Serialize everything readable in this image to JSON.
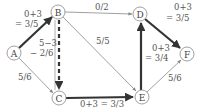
{
  "diagram": {
    "type": "flow-network",
    "nodes": [
      {
        "id": "A",
        "label": "A",
        "x": 14,
        "y": 53
      },
      {
        "id": "B",
        "label": "B",
        "x": 58,
        "y": 12
      },
      {
        "id": "C",
        "label": "C",
        "x": 59,
        "y": 98
      },
      {
        "id": "D",
        "label": "D",
        "x": 140,
        "y": 14
      },
      {
        "id": "E",
        "label": "E",
        "x": 142,
        "y": 97
      },
      {
        "id": "F",
        "label": "F",
        "x": 187,
        "y": 54
      }
    ],
    "edges": [
      {
        "from": "A",
        "to": "B",
        "style": "thick",
        "label_line1": "0+3",
        "label_line2": "= 3/5"
      },
      {
        "from": "A",
        "to": "C",
        "style": "thin",
        "label_line1": "5/6"
      },
      {
        "from": "B",
        "to": "C",
        "style": "dashed-thick",
        "label_line1": "5−3",
        "label_line2": "− 2/6"
      },
      {
        "from": "B",
        "to": "D",
        "style": "thin",
        "label_line1": "0/2"
      },
      {
        "from": "B",
        "to": "E",
        "style": "thin",
        "label_line1": "5/5"
      },
      {
        "from": "C",
        "to": "E",
        "style": "thick",
        "label_line1": "0+3 = 3/3"
      },
      {
        "from": "E",
        "to": "D",
        "style": "thick",
        "label_line1": "0+3",
        "label_line2": "= 3/4"
      },
      {
        "from": "D",
        "to": "F",
        "style": "thick",
        "label_line1": "0+3",
        "label_line2": "= 3/5"
      },
      {
        "from": "E",
        "to": "F",
        "style": "thin",
        "label_line1": "5/6"
      }
    ]
  },
  "colors": {
    "thin_edge": "#888888",
    "thick_edge": "#333333",
    "node_stroke": "#888888",
    "text": "#555555"
  }
}
